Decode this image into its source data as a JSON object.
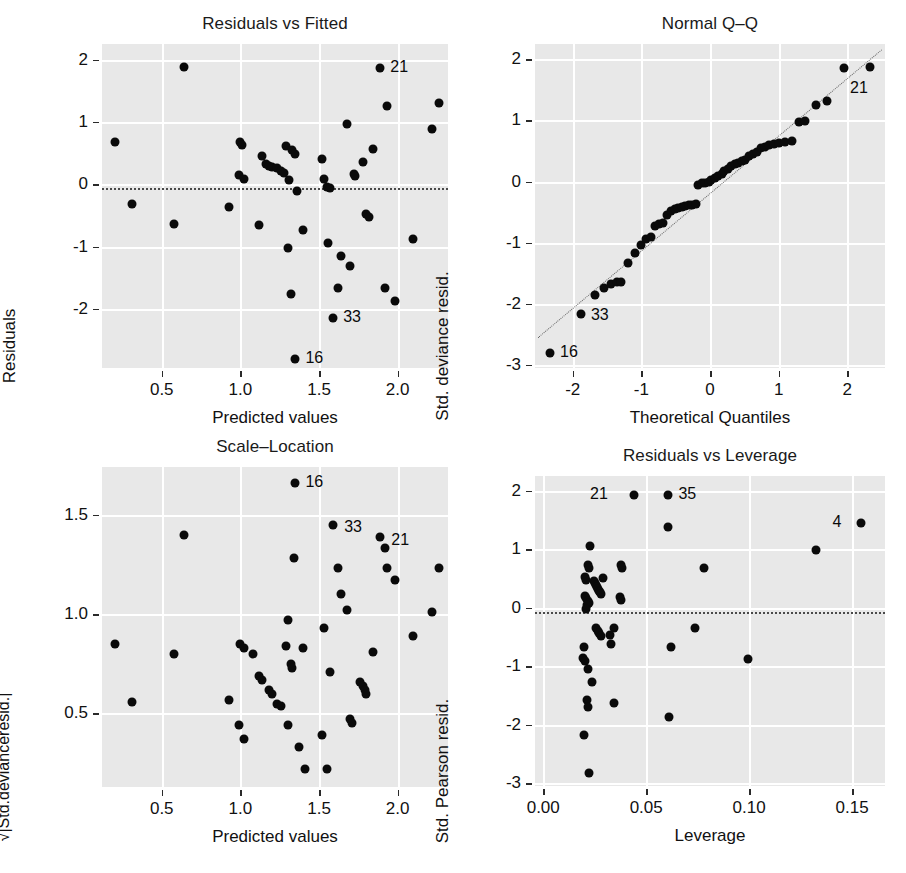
{
  "figure": {
    "kind": "glm-diagnostic-2x2",
    "background": "#ffffff",
    "panel_bg": "#e8e8e8",
    "grid_color": "#ffffff",
    "point_color": "#0a0a0a"
  },
  "chart_data": [
    {
      "type": "scatter",
      "id": "residuals-vs-fitted",
      "title": "Residuals vs Fitted",
      "xlabel": "Predicted values",
      "ylabel": "Residuals",
      "xticks": [
        0.5,
        1.0,
        1.5,
        2.0
      ],
      "xticklabels": [
        "0.5",
        "1.0",
        "1.5",
        "2.0"
      ],
      "yticks": [
        2,
        1,
        0,
        -1,
        -2
      ],
      "yticklabels": [
        "2",
        "1",
        "0",
        "-1",
        "-2"
      ],
      "xlim": [
        0.12,
        2.32
      ],
      "ylim": [
        -2.95,
        2.25
      ],
      "grid": true,
      "reference_line": {
        "type": "horizontal-dotted",
        "y": -0.06
      },
      "points": [
        {
          "x": 0.2,
          "y": 0.68
        },
        {
          "x": 0.64,
          "y": 1.88
        },
        {
          "x": 0.31,
          "y": -0.31
        },
        {
          "x": 0.58,
          "y": -0.64
        },
        {
          "x": 0.93,
          "y": -0.37
        },
        {
          "x": 1.0,
          "y": 0.67
        },
        {
          "x": 1.01,
          "y": 0.63
        },
        {
          "x": 0.99,
          "y": 0.14
        },
        {
          "x": 1.02,
          "y": 0.09
        },
        {
          "x": 1.12,
          "y": -0.65
        },
        {
          "x": 1.14,
          "y": 0.45
        },
        {
          "x": 1.16,
          "y": 0.33
        },
        {
          "x": 1.18,
          "y": 0.3
        },
        {
          "x": 1.2,
          "y": 0.28
        },
        {
          "x": 1.23,
          "y": 0.26
        },
        {
          "x": 1.29,
          "y": 0.62
        },
        {
          "x": 1.26,
          "y": 0.21
        },
        {
          "x": 1.28,
          "y": 0.18
        },
        {
          "x": 1.33,
          "y": 0.55
        },
        {
          "x": 1.35,
          "y": 0.49
        },
        {
          "x": 1.31,
          "y": 0.07
        },
        {
          "x": 1.3,
          "y": -1.02
        },
        {
          "x": 1.32,
          "y": -1.76
        },
        {
          "x": 1.36,
          "y": -0.11
        },
        {
          "x": 1.35,
          "y": -2.8
        },
        {
          "x": 1.4,
          "y": -0.73
        },
        {
          "x": 1.53,
          "y": 0.09
        },
        {
          "x": 1.52,
          "y": 0.41
        },
        {
          "x": 1.55,
          "y": -0.05
        },
        {
          "x": 1.57,
          "y": -0.06
        },
        {
          "x": 1.56,
          "y": -0.94
        },
        {
          "x": 1.59,
          "y": -2.15
        },
        {
          "x": 1.62,
          "y": -1.66
        },
        {
          "x": 1.64,
          "y": -1.16
        },
        {
          "x": 1.68,
          "y": 0.97
        },
        {
          "x": 1.72,
          "y": 0.17
        },
        {
          "x": 1.73,
          "y": 0.13
        },
        {
          "x": 1.7,
          "y": -1.31
        },
        {
          "x": 1.78,
          "y": 0.36
        },
        {
          "x": 1.8,
          "y": -0.48
        },
        {
          "x": 1.82,
          "y": -0.53
        },
        {
          "x": 1.84,
          "y": 0.57
        },
        {
          "x": 1.89,
          "y": 1.86
        },
        {
          "x": 1.93,
          "y": 1.25
        },
        {
          "x": 1.92,
          "y": -1.66
        },
        {
          "x": 1.98,
          "y": -1.87
        },
        {
          "x": 2.1,
          "y": -0.88
        },
        {
          "x": 2.22,
          "y": 0.88
        },
        {
          "x": 2.26,
          "y": 1.31
        }
      ],
      "outlier_labels": [
        {
          "text": "21",
          "x": 1.89,
          "y": 1.86,
          "dx": 10,
          "dy": 0
        },
        {
          "text": "33",
          "x": 1.59,
          "y": -2.15,
          "dx": 10,
          "dy": 0
        },
        {
          "text": "16",
          "x": 1.35,
          "y": -2.8,
          "dx": 10,
          "dy": 0
        }
      ]
    },
    {
      "type": "scatter",
      "id": "normal-qq",
      "title": "Normal Q–Q",
      "xlabel": "Theoretical Quantiles",
      "ylabel": "Std. deviance resid.",
      "xticks": [
        -2,
        -1,
        0,
        1,
        2
      ],
      "xticklabels": [
        "-2",
        "-1",
        "0",
        "1",
        "2"
      ],
      "yticks": [
        2,
        1,
        0,
        -1,
        -2,
        -3
      ],
      "yticklabels": [
        "2",
        "1",
        "0",
        "-1",
        "-2",
        "-3"
      ],
      "xlim": [
        -2.55,
        2.55
      ],
      "ylim": [
        -3.05,
        2.25
      ],
      "grid": true,
      "reference_line": {
        "type": "qq-diagonal",
        "x1": -2.5,
        "y1": -2.55,
        "x2": 2.5,
        "y2": 2.15
      },
      "points": [
        {
          "x": -2.33,
          "y": -2.81
        },
        {
          "x": -1.88,
          "y": -2.16
        },
        {
          "x": -1.68,
          "y": -1.86
        },
        {
          "x": -1.54,
          "y": -1.74
        },
        {
          "x": -1.44,
          "y": -1.68
        },
        {
          "x": -1.36,
          "y": -1.65
        },
        {
          "x": -1.3,
          "y": -1.64
        },
        {
          "x": -1.2,
          "y": -1.34
        },
        {
          "x": -1.1,
          "y": -1.17
        },
        {
          "x": -1.0,
          "y": -1.04
        },
        {
          "x": -0.93,
          "y": -0.94
        },
        {
          "x": -0.86,
          "y": -0.9
        },
        {
          "x": -0.8,
          "y": -0.72
        },
        {
          "x": -0.74,
          "y": -0.7
        },
        {
          "x": -0.68,
          "y": -0.67
        },
        {
          "x": -0.62,
          "y": -0.55
        },
        {
          "x": -0.57,
          "y": -0.48
        },
        {
          "x": -0.51,
          "y": -0.45
        },
        {
          "x": -0.46,
          "y": -0.43
        },
        {
          "x": -0.41,
          "y": -0.42
        },
        {
          "x": -0.36,
          "y": -0.4
        },
        {
          "x": -0.31,
          "y": -0.39
        },
        {
          "x": -0.26,
          "y": -0.38
        },
        {
          "x": -0.21,
          "y": -0.37
        },
        {
          "x": -0.17,
          "y": -0.06
        },
        {
          "x": -0.12,
          "y": -0.03
        },
        {
          "x": -0.07,
          "y": -0.02
        },
        {
          "x": -0.02,
          "y": 0.0
        },
        {
          "x": 0.02,
          "y": 0.02
        },
        {
          "x": 0.07,
          "y": 0.05
        },
        {
          "x": 0.12,
          "y": 0.09
        },
        {
          "x": 0.17,
          "y": 0.13
        },
        {
          "x": 0.21,
          "y": 0.17
        },
        {
          "x": 0.26,
          "y": 0.21
        },
        {
          "x": 0.31,
          "y": 0.26
        },
        {
          "x": 0.36,
          "y": 0.28
        },
        {
          "x": 0.41,
          "y": 0.3
        },
        {
          "x": 0.46,
          "y": 0.33
        },
        {
          "x": 0.51,
          "y": 0.36
        },
        {
          "x": 0.57,
          "y": 0.41
        },
        {
          "x": 0.62,
          "y": 0.45
        },
        {
          "x": 0.68,
          "y": 0.49
        },
        {
          "x": 0.74,
          "y": 0.55
        },
        {
          "x": 0.8,
          "y": 0.57
        },
        {
          "x": 0.86,
          "y": 0.6
        },
        {
          "x": 0.93,
          "y": 0.62
        },
        {
          "x": 1.0,
          "y": 0.63
        },
        {
          "x": 1.1,
          "y": 0.65
        },
        {
          "x": 1.2,
          "y": 0.67
        },
        {
          "x": 1.3,
          "y": 0.97
        },
        {
          "x": 1.38,
          "y": 0.99
        },
        {
          "x": 1.54,
          "y": 1.25
        },
        {
          "x": 1.7,
          "y": 1.31
        },
        {
          "x": 1.95,
          "y": 1.86
        },
        {
          "x": 2.33,
          "y": 1.88
        }
      ],
      "outlier_labels": [
        {
          "text": "21",
          "x": 2.33,
          "y": 1.88,
          "dx": -2,
          "dy": 22
        },
        {
          "text": "33",
          "x": -1.88,
          "y": -2.16,
          "dx": 10,
          "dy": 2
        },
        {
          "text": "16",
          "x": -2.33,
          "y": -2.81,
          "dx": 10,
          "dy": 0
        }
      ]
    },
    {
      "type": "scatter",
      "id": "scale-location",
      "title": "Scale–Location",
      "xlabel": "Predicted values",
      "ylabel": "√|Std.devianceresid.|",
      "xticks": [
        0.5,
        1.0,
        1.5,
        2.0
      ],
      "xticklabels": [
        "0.5",
        "1.0",
        "1.5",
        "2.0"
      ],
      "yticks": [
        1.5,
        1.0,
        0.5
      ],
      "yticklabels": [
        "1.5",
        "1.0",
        "0.5"
      ],
      "xlim": [
        0.12,
        2.32
      ],
      "ylim": [
        0.13,
        1.74
      ],
      "grid": true,
      "points": [
        {
          "x": 0.2,
          "y": 0.85
        },
        {
          "x": 0.31,
          "y": 0.56
        },
        {
          "x": 0.58,
          "y": 0.8
        },
        {
          "x": 0.64,
          "y": 1.4
        },
        {
          "x": 0.93,
          "y": 0.57
        },
        {
          "x": 1.0,
          "y": 0.85
        },
        {
          "x": 1.02,
          "y": 0.83
        },
        {
          "x": 0.99,
          "y": 0.44
        },
        {
          "x": 1.02,
          "y": 0.37
        },
        {
          "x": 1.08,
          "y": 0.8
        },
        {
          "x": 1.12,
          "y": 0.69
        },
        {
          "x": 1.14,
          "y": 0.67
        },
        {
          "x": 1.18,
          "y": 0.62
        },
        {
          "x": 1.2,
          "y": 0.6
        },
        {
          "x": 1.23,
          "y": 0.55
        },
        {
          "x": 1.26,
          "y": 0.54
        },
        {
          "x": 1.29,
          "y": 0.84
        },
        {
          "x": 1.3,
          "y": 0.97
        },
        {
          "x": 1.32,
          "y": 0.75
        },
        {
          "x": 1.33,
          "y": 0.73
        },
        {
          "x": 1.3,
          "y": 0.44
        },
        {
          "x": 1.34,
          "y": 1.28
        },
        {
          "x": 1.35,
          "y": 1.66
        },
        {
          "x": 1.37,
          "y": 0.33
        },
        {
          "x": 1.4,
          "y": 0.83
        },
        {
          "x": 1.41,
          "y": 0.22
        },
        {
          "x": 1.53,
          "y": 0.93
        },
        {
          "x": 1.52,
          "y": 0.39
        },
        {
          "x": 1.55,
          "y": 0.22
        },
        {
          "x": 1.57,
          "y": 0.71
        },
        {
          "x": 1.59,
          "y": 1.45
        },
        {
          "x": 1.62,
          "y": 1.23
        },
        {
          "x": 1.64,
          "y": 1.1
        },
        {
          "x": 1.68,
          "y": 1.02
        },
        {
          "x": 1.7,
          "y": 0.47
        },
        {
          "x": 1.71,
          "y": 0.45
        },
        {
          "x": 1.76,
          "y": 0.66
        },
        {
          "x": 1.78,
          "y": 0.64
        },
        {
          "x": 1.79,
          "y": 0.62
        },
        {
          "x": 1.8,
          "y": 0.6
        },
        {
          "x": 1.84,
          "y": 0.81
        },
        {
          "x": 1.89,
          "y": 1.39
        },
        {
          "x": 1.92,
          "y": 1.33
        },
        {
          "x": 1.93,
          "y": 1.23
        },
        {
          "x": 1.98,
          "y": 1.17
        },
        {
          "x": 2.1,
          "y": 0.89
        },
        {
          "x": 2.22,
          "y": 1.01
        },
        {
          "x": 2.26,
          "y": 1.23
        }
      ],
      "outlier_labels": [
        {
          "text": "16",
          "x": 1.35,
          "y": 1.66,
          "dx": 10,
          "dy": 0
        },
        {
          "text": "33",
          "x": 1.59,
          "y": 1.45,
          "dx": 11,
          "dy": 3
        },
        {
          "text": "21",
          "x": 1.89,
          "y": 1.39,
          "dx": 11,
          "dy": 4
        }
      ]
    },
    {
      "type": "scatter",
      "id": "residuals-vs-leverage",
      "title": "Residuals vs Leverage",
      "xlabel": "Leverage",
      "ylabel": "Std. Pearson resid.",
      "xticks": [
        0.0,
        0.05,
        0.1,
        0.15
      ],
      "xticklabels": [
        "0.00",
        "0.05",
        "0.10",
        "0.15"
      ],
      "yticks": [
        2,
        1,
        0,
        -1,
        -2,
        -3
      ],
      "yticklabels": [
        "2",
        "1",
        "0",
        "-1",
        "-2",
        "-3"
      ],
      "xlim": [
        -0.004,
        0.166
      ],
      "ylim": [
        -3.05,
        2.25
      ],
      "grid": true,
      "reference_line": {
        "type": "horizontal-dotted",
        "y": -0.08
      },
      "points": [
        {
          "x": 0.0225,
          "y": 1.05
        },
        {
          "x": 0.0215,
          "y": 0.72
        },
        {
          "x": 0.0222,
          "y": 0.68
        },
        {
          "x": 0.0205,
          "y": 0.52
        },
        {
          "x": 0.021,
          "y": 0.48
        },
        {
          "x": 0.0248,
          "y": 0.46
        },
        {
          "x": 0.0252,
          "y": 0.42
        },
        {
          "x": 0.0256,
          "y": 0.38
        },
        {
          "x": 0.0262,
          "y": 0.35
        },
        {
          "x": 0.0268,
          "y": 0.32
        },
        {
          "x": 0.0272,
          "y": 0.29
        },
        {
          "x": 0.0278,
          "y": 0.26
        },
        {
          "x": 0.0282,
          "y": 0.23
        },
        {
          "x": 0.0288,
          "y": 0.5
        },
        {
          "x": 0.0205,
          "y": 0.2
        },
        {
          "x": 0.021,
          "y": 0.16
        },
        {
          "x": 0.0215,
          "y": 0.12
        },
        {
          "x": 0.022,
          "y": 0.08
        },
        {
          "x": 0.0212,
          "y": 0.04
        },
        {
          "x": 0.0207,
          "y": -0.03
        },
        {
          "x": 0.0378,
          "y": 0.72
        },
        {
          "x": 0.0384,
          "y": 0.68
        },
        {
          "x": 0.0372,
          "y": 0.18
        },
        {
          "x": 0.038,
          "y": 0.13
        },
        {
          "x": 0.0258,
          "y": -0.35
        },
        {
          "x": 0.0265,
          "y": -0.4
        },
        {
          "x": 0.0272,
          "y": -0.44
        },
        {
          "x": 0.0282,
          "y": -0.48
        },
        {
          "x": 0.0345,
          "y": -0.35
        },
        {
          "x": 0.0322,
          "y": -0.46
        },
        {
          "x": 0.033,
          "y": -0.63
        },
        {
          "x": 0.0198,
          "y": -0.67
        },
        {
          "x": 0.0195,
          "y": -0.86
        },
        {
          "x": 0.0205,
          "y": -0.92
        },
        {
          "x": 0.0218,
          "y": -1.05
        },
        {
          "x": 0.0235,
          "y": -1.27
        },
        {
          "x": 0.0212,
          "y": -1.58
        },
        {
          "x": 0.0218,
          "y": -1.7
        },
        {
          "x": 0.02,
          "y": -2.17
        },
        {
          "x": 0.0222,
          "y": -2.82
        },
        {
          "x": 0.0345,
          "y": -1.63
        },
        {
          "x": 0.044,
          "y": 1.93
        },
        {
          "x": 0.0608,
          "y": 1.92
        },
        {
          "x": 0.0605,
          "y": 1.37
        },
        {
          "x": 0.0612,
          "y": -1.87
        },
        {
          "x": 0.062,
          "y": -0.67
        },
        {
          "x": 0.0735,
          "y": -0.35
        },
        {
          "x": 0.078,
          "y": 0.68
        },
        {
          "x": 0.0995,
          "y": -0.88
        },
        {
          "x": 0.1325,
          "y": 0.99
        },
        {
          "x": 0.1545,
          "y": 1.45
        }
      ],
      "outlier_labels": [
        {
          "text": "21",
          "x": 0.044,
          "y": 1.93,
          "dx": -26,
          "dy": 0
        },
        {
          "text": "35",
          "x": 0.0608,
          "y": 1.92,
          "dx": 10,
          "dy": 0
        },
        {
          "text": "4",
          "x": 0.1545,
          "y": 1.45,
          "dx": -20,
          "dy": 0
        }
      ]
    }
  ]
}
